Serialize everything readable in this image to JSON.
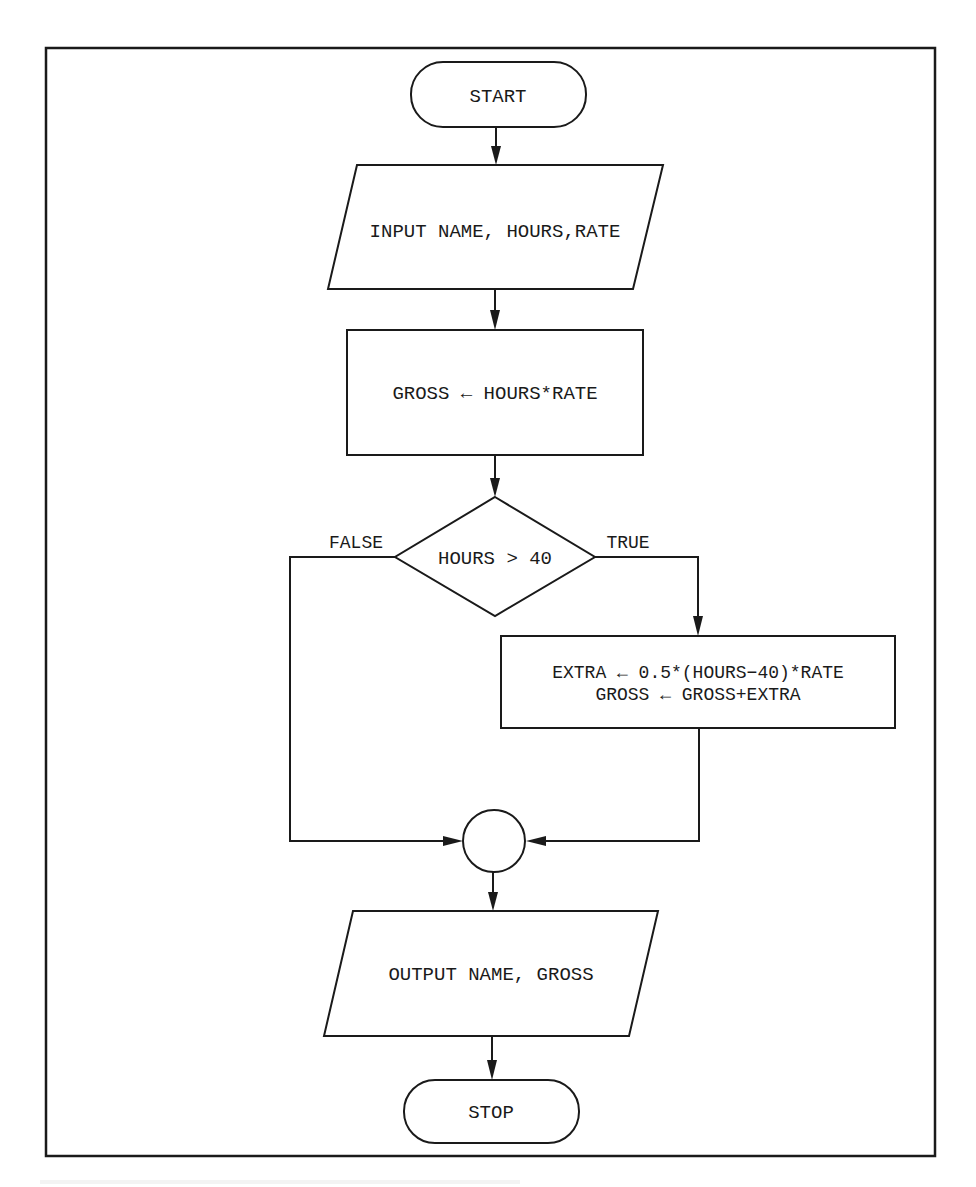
{
  "diagram": {
    "type": "flowchart",
    "nodes": {
      "start": {
        "shape": "terminator",
        "label": "START"
      },
      "input": {
        "shape": "input-output",
        "label": "INPUT NAME, HOURS,RATE"
      },
      "compute_gross": {
        "shape": "process",
        "label": "GROSS ← HOURS*RATE"
      },
      "decision": {
        "shape": "decision",
        "label": "HOURS > 40"
      },
      "overtime": {
        "shape": "process",
        "line1": "EXTRA ← 0.5*(HOURS−40)*RATE",
        "line2": "GROSS ← GROSS+EXTRA"
      },
      "connector": {
        "shape": "connector",
        "label": ""
      },
      "output": {
        "shape": "input-output",
        "label": "OUTPUT NAME, GROSS"
      },
      "stop": {
        "shape": "terminator",
        "label": "STOP"
      }
    },
    "edges": {
      "false_label": "FALSE",
      "true_label": "TRUE"
    },
    "flow": [
      [
        "start",
        "input"
      ],
      [
        "input",
        "compute_gross"
      ],
      [
        "compute_gross",
        "decision"
      ],
      [
        "decision",
        "connector",
        "FALSE"
      ],
      [
        "decision",
        "overtime",
        "TRUE"
      ],
      [
        "overtime",
        "connector"
      ],
      [
        "connector",
        "output"
      ],
      [
        "output",
        "stop"
      ]
    ],
    "colors": {
      "stroke": "#1a1a1a",
      "background": "#ffffff"
    }
  }
}
